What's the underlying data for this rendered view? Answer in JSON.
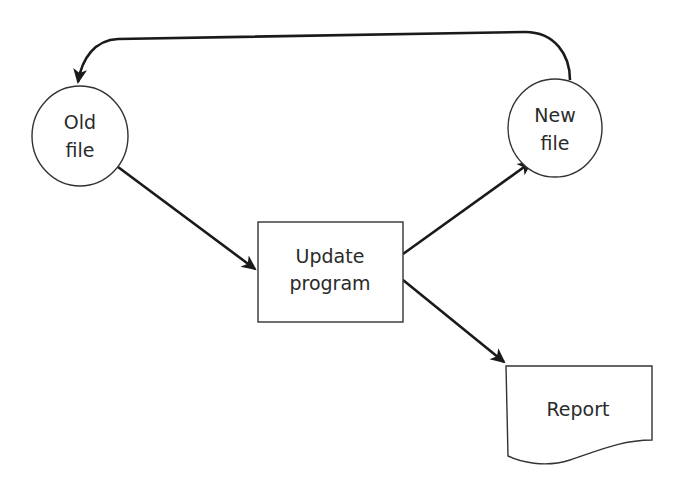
{
  "diagram": {
    "type": "data-flow",
    "nodes": {
      "old_file": {
        "shape": "circle",
        "line1": "Old",
        "line2": "file"
      },
      "new_file": {
        "shape": "circle",
        "line1": "New",
        "line2": "file"
      },
      "update_program": {
        "shape": "rectangle",
        "line1": "Update",
        "line2": "program"
      },
      "report": {
        "shape": "document",
        "label": "Report"
      }
    },
    "edges": [
      {
        "from": "Old file",
        "to": "Update program"
      },
      {
        "from": "Update program",
        "to": "New file"
      },
      {
        "from": "Update program",
        "to": "Report"
      },
      {
        "from": "New file",
        "to": "Old file"
      }
    ],
    "colors": {
      "stroke": "#1a1a1a",
      "text": "#2a2a2a",
      "background": "#ffffff"
    }
  }
}
